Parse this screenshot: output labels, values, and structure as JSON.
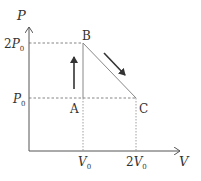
{
  "diagram": {
    "type": "pv-diagram",
    "axes": {
      "y_label": "P",
      "x_label": "V",
      "y_ticks": [
        {
          "coef": "2",
          "sym": "P",
          "sub": "0"
        },
        {
          "coef": "",
          "sym": "P",
          "sub": "0"
        }
      ],
      "x_ticks": [
        {
          "coef": "",
          "sym": "V",
          "sub": "0"
        },
        {
          "coef": "2",
          "sym": "V",
          "sub": "0"
        }
      ]
    },
    "points": [
      {
        "label": "A",
        "V": "V0",
        "P": "P0"
      },
      {
        "label": "B",
        "V": "V0",
        "P": "2P0"
      },
      {
        "label": "C",
        "V": "2V0",
        "P": "P0"
      }
    ],
    "process": [
      {
        "from": "A",
        "to": "B",
        "direction": "up"
      },
      {
        "from": "B",
        "to": "C",
        "direction": "down-right"
      }
    ],
    "colors": {
      "axis": "#555555",
      "process_line": "#888888",
      "arrow": "#333333",
      "dashed": "#666666"
    }
  }
}
